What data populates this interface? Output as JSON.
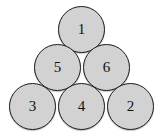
{
  "figure": {
    "type": "node-arrangement",
    "background_color": "#ffffff",
    "node_fill_color": "#d2d2d2",
    "node_border_color": "#1c1c1c",
    "label_color": "#111111",
    "rows": [
      {
        "name": "top-row",
        "labels": [
          "1"
        ]
      },
      {
        "name": "middle-row",
        "labels": [
          "5",
          "6"
        ]
      },
      {
        "name": "bottom-row",
        "labels": [
          "3",
          "4",
          "2"
        ]
      }
    ],
    "nodes": [
      {
        "id": "node-1",
        "label": "1",
        "x": 58,
        "y": 6,
        "size": 47
      },
      {
        "id": "node-5",
        "label": "5",
        "x": 34,
        "y": 44,
        "size": 47
      },
      {
        "id": "node-6",
        "label": "6",
        "x": 83,
        "y": 44,
        "size": 47
      },
      {
        "id": "node-3",
        "label": "3",
        "x": 9,
        "y": 83,
        "size": 47
      },
      {
        "id": "node-4",
        "label": "4",
        "x": 58,
        "y": 83,
        "size": 47
      },
      {
        "id": "node-2",
        "label": "2",
        "x": 107,
        "y": 83,
        "size": 47
      }
    ]
  }
}
